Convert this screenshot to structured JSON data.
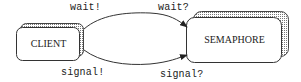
{
  "diagram": {
    "type": "message-sequence",
    "nodes": [
      {
        "id": "client",
        "label": "CLIENT"
      },
      {
        "id": "semaphore",
        "label": "SEMAPHORE"
      }
    ],
    "edges": [
      {
        "from": "client",
        "to": "semaphore",
        "send_label": "wait!",
        "receive_label": "wait?"
      },
      {
        "from": "client",
        "to": "semaphore",
        "send_label": "signal!",
        "receive_label": "signal?"
      }
    ],
    "colors": {
      "stroke": "#333333",
      "text": "#222222",
      "background": "#ffffff",
      "shadow_hatch": "#888888"
    }
  }
}
